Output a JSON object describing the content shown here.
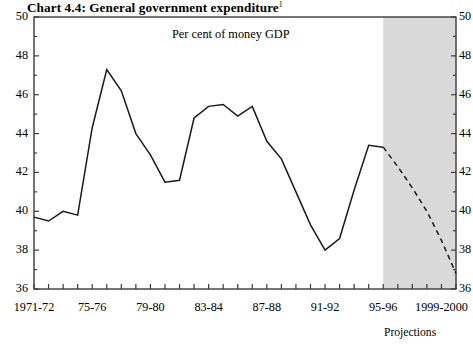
{
  "chart_data": {
    "type": "line",
    "title": "Chart 4.4: General government expenditure",
    "title_footnote": "1",
    "subtitle": "Per cent of money GDP",
    "xlabel": "",
    "ylabel": "",
    "ylim": [
      36,
      50
    ],
    "ytick_step": 2,
    "yminor_step": 1,
    "grid": false,
    "legend": null,
    "xtick_labels": [
      "1971-72",
      "75-76",
      "79-80",
      "83-84",
      "87-88",
      "91-92",
      "95-96",
      "1999-2000"
    ],
    "xtick_label_x": [
      "1971-72",
      "75-76",
      "79-80",
      "83-84",
      "87-88",
      "91-92",
      "95-96",
      "1999-2000"
    ],
    "yticks": [
      36,
      38,
      40,
      42,
      44,
      46,
      48,
      50
    ],
    "ytick_labels_left": [
      "36",
      "38",
      "40",
      "42",
      "44",
      "46",
      "48",
      "50"
    ],
    "ytick_labels_right": [
      "36",
      "38",
      "40",
      "42",
      "44",
      "46",
      "48",
      "50"
    ],
    "annotations": [
      {
        "text": "Projections",
        "x_year": "1998-99",
        "note": "label under shaded region"
      }
    ],
    "shaded_region": {
      "label": "Projections",
      "start_x": "1995-96",
      "end_x": "2000-01",
      "color": "#d9d9d9"
    },
    "series": [
      {
        "name": "General government expenditure (outturn)",
        "style": "solid",
        "color": "#1a1a1a",
        "x": [
          "1971-72",
          "1972-73",
          "1973-74",
          "1974-75",
          "1975-76",
          "1976-77",
          "1977-78",
          "1978-79",
          "1979-80",
          "1980-81",
          "1981-82",
          "1982-83",
          "1983-84",
          "1984-85",
          "1985-86",
          "1986-87",
          "1987-88",
          "1988-89",
          "1989-90",
          "1990-91",
          "1991-92",
          "1992-93",
          "1993-94",
          "1994-95",
          "1995-96"
        ],
        "values": [
          39.7,
          39.5,
          40.0,
          39.8,
          44.3,
          47.3,
          46.2,
          44.0,
          42.9,
          41.5,
          41.6,
          44.8,
          45.4,
          45.5,
          44.9,
          45.4,
          43.6,
          42.7,
          41.0,
          39.3,
          38.0,
          38.6,
          41.1,
          43.4,
          43.3
        ]
      },
      {
        "name": "General government expenditure (projection)",
        "style": "dashed",
        "color": "#1a1a1a",
        "x": [
          "1995-96",
          "1996-97",
          "1997-98",
          "1998-99",
          "1999-2000",
          "2000-01"
        ],
        "values": [
          43.3,
          42.3,
          41.2,
          40.0,
          38.5,
          36.8
        ]
      }
    ]
  }
}
